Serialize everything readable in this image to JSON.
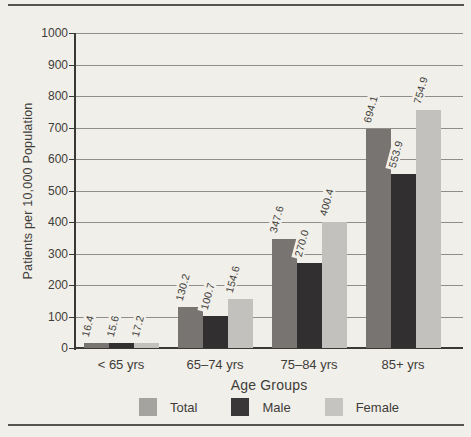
{
  "chart_data": {
    "type": "bar",
    "title": "",
    "categories": [
      "< 65 yrs",
      "65–74 yrs",
      "75–84 yrs",
      "85+ yrs"
    ],
    "series": [
      {
        "name": "Total",
        "color": "#787471",
        "legend_color": "#a5a3a0",
        "values": [
          16.4,
          130.2,
          347.6,
          694.1
        ],
        "labels": [
          "16.4",
          "130.2",
          "347.6",
          "694.1"
        ]
      },
      {
        "name": "Male",
        "color": "#322f30",
        "legend_color": "#3a3738",
        "values": [
          15.6,
          100.7,
          270.0,
          553.9
        ],
        "labels": [
          "15.6",
          "100.7",
          "270.0",
          "553.9"
        ]
      },
      {
        "name": "Female",
        "color": "#c2c1bd",
        "legend_color": "#c5c4c1",
        "values": [
          17.2,
          154.6,
          400.4,
          754.9
        ],
        "labels": [
          "17.2",
          "154.6",
          "400.4",
          "754.9"
        ]
      }
    ],
    "xlabel": "Age Groups",
    "ylabel": "Patients per 10,000 Population",
    "ylim": [
      0,
      1000
    ],
    "grid": true,
    "legend_position": "bottom",
    "yticks": [
      {
        "label": "1000",
        "value": 1000
      },
      {
        "label": "900",
        "value": 900
      },
      {
        "label": "800",
        "value": 800
      },
      {
        "label": "700",
        "value": 700
      },
      {
        "label": "600",
        "value": 600
      },
      {
        "label": "500",
        "value": 500
      },
      {
        "label": "400",
        "value": 400
      },
      {
        "label": "300",
        "value": 300
      },
      {
        "label": "200",
        "value": 200
      },
      {
        "label": "100",
        "value": 100
      },
      {
        "label": "0",
        "value": 0
      }
    ]
  },
  "colors": {
    "paper": "#f1efe9",
    "rule": "#57544e",
    "gridline": "#908e89",
    "axis": "#3b3935",
    "text": "#3f3d39"
  }
}
